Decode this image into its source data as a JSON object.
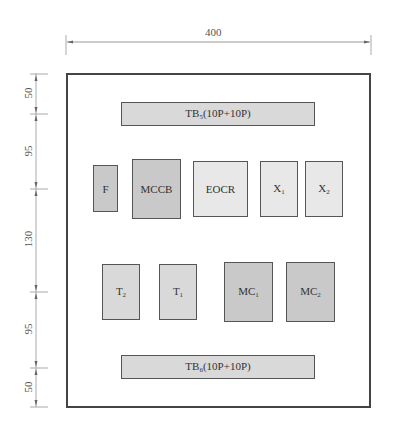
{
  "dimensions": {
    "width_label": "400",
    "vertical": [
      {
        "label": "50"
      },
      {
        "label": "95"
      },
      {
        "label": "130"
      },
      {
        "label": "95"
      },
      {
        "label": "50"
      }
    ]
  },
  "components": {
    "tb5": {
      "main": "TB",
      "sub": "5",
      "suffix": "(10P+10P)"
    },
    "f": {
      "label": "F"
    },
    "mccb": {
      "label": "MCCB"
    },
    "eocr": {
      "label": "EOCR"
    },
    "x1": {
      "main": "X",
      "sub": "1"
    },
    "x2": {
      "main": "X",
      "sub": "2"
    },
    "t2": {
      "main": "T",
      "sub": "2"
    },
    "t1": {
      "main": "T",
      "sub": "1"
    },
    "mc1": {
      "main": "MC",
      "sub": "1"
    },
    "mc2": {
      "main": "MC",
      "sub": "2"
    },
    "tb6": {
      "main": "TB",
      "sub": "6",
      "suffix": "(10P+10P)"
    }
  },
  "colors": {
    "dark_fill": "#c9c9c9",
    "mid_fill": "#d9d9d9",
    "light_fill": "#e8e8e8",
    "border": "#555555"
  }
}
